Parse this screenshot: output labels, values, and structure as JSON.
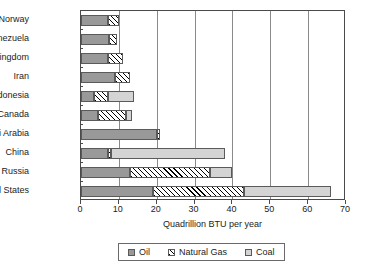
{
  "chart_data": {
    "type": "bar",
    "orientation": "horizontal",
    "stacked": true,
    "title": "",
    "xlabel": "Quadrillion BTU per year",
    "ylabel": "",
    "xlim": [
      0,
      70
    ],
    "xticks": [
      0,
      10,
      20,
      30,
      40,
      50,
      60,
      70
    ],
    "grid": true,
    "grid_axis": "x",
    "legend_position": "bottom",
    "categories": [
      "Norway",
      "Venezuela",
      "United Kingdom",
      "Iran",
      "Indonesia",
      "Canada",
      "Saudi Arabia",
      "China",
      "Russia",
      "United States"
    ],
    "series": [
      {
        "name": "Oil",
        "fill": "solid-gray",
        "color": "#999999",
        "values": [
          7,
          7.5,
          7,
          9,
          3.5,
          4.5,
          20,
          7,
          13,
          19
        ]
      },
      {
        "name": "Natural Gas",
        "fill": "diagonal-hatch",
        "color": "#ffffff",
        "values": [
          3,
          2,
          4,
          4,
          3.5,
          7.5,
          1,
          1,
          21,
          24
        ]
      },
      {
        "name": "Coal",
        "fill": "solid-light-gray",
        "color": "#d4d4d4",
        "values": [
          0,
          0,
          0,
          0,
          7,
          1.5,
          0,
          30,
          6,
          23
        ]
      }
    ],
    "totals": [
      10,
      9.5,
      11,
      13,
      14,
      13.5,
      21,
      38,
      40,
      66
    ]
  },
  "legend": {
    "items": [
      {
        "label": "Oil",
        "swatch": "oil-swatch"
      },
      {
        "label": "Natural Gas",
        "swatch": "natural-gas-swatch"
      },
      {
        "label": "Coal",
        "swatch": "coal-swatch"
      }
    ]
  },
  "colors": {
    "oil": "#999999",
    "natural_gas": "#ffffff",
    "coal": "#d4d4d4",
    "axis": "#4a4a4a",
    "grid": "#8a8a8a"
  }
}
